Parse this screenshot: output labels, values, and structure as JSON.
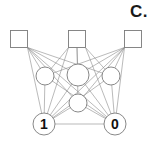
{
  "figure": {
    "panel_label": "C.",
    "width": 154,
    "height": 145,
    "background_color": "#ffffff",
    "edge_color": "#8c8c8c",
    "node_stroke_color": "#7a7a7a",
    "node_fill_color": "#ffffff",
    "label_color": "#111111"
  },
  "chart_data": {
    "type": "diagram",
    "title": "C.",
    "layers": [
      {
        "name": "top-layer",
        "shape": "square",
        "nodes": [
          {
            "id": "s1",
            "label": "",
            "x": 19,
            "y": 39,
            "size": 17
          },
          {
            "id": "s2",
            "label": "",
            "x": 77,
            "y": 39,
            "size": 17
          },
          {
            "id": "s3",
            "label": "",
            "x": 133,
            "y": 39,
            "size": 17
          }
        ]
      },
      {
        "name": "hidden-layer",
        "shape": "circle",
        "nodes": [
          {
            "id": "h1",
            "label": "",
            "x": 45,
            "y": 76,
            "r": 9
          },
          {
            "id": "h2",
            "label": "",
            "x": 78,
            "y": 75,
            "r": 11
          },
          {
            "id": "h3",
            "label": "",
            "x": 111,
            "y": 76,
            "r": 9
          },
          {
            "id": "h4",
            "label": "",
            "x": 78,
            "y": 103,
            "r": 9
          }
        ]
      },
      {
        "name": "bottom-layer",
        "shape": "circle",
        "nodes": [
          {
            "id": "b1",
            "label": "1",
            "x": 44,
            "y": 124,
            "r": 11
          },
          {
            "id": "b2",
            "label": "0",
            "x": 115,
            "y": 124,
            "r": 11
          }
        ]
      }
    ],
    "edges": [
      {
        "from": "s1",
        "to": "h1"
      },
      {
        "from": "s1",
        "to": "h2"
      },
      {
        "from": "s1",
        "to": "h3"
      },
      {
        "from": "s1",
        "to": "h4"
      },
      {
        "from": "s1",
        "to": "b1"
      },
      {
        "from": "s1",
        "to": "b2"
      },
      {
        "from": "s2",
        "to": "h1"
      },
      {
        "from": "s2",
        "to": "h2"
      },
      {
        "from": "s2",
        "to": "h3"
      },
      {
        "from": "s2",
        "to": "h4"
      },
      {
        "from": "s2",
        "to": "b1"
      },
      {
        "from": "s2",
        "to": "b2"
      },
      {
        "from": "s3",
        "to": "h1"
      },
      {
        "from": "s3",
        "to": "h2"
      },
      {
        "from": "s3",
        "to": "h3"
      },
      {
        "from": "s3",
        "to": "h4"
      },
      {
        "from": "s3",
        "to": "b1"
      },
      {
        "from": "s3",
        "to": "b2"
      },
      {
        "from": "h1",
        "to": "b1"
      },
      {
        "from": "h1",
        "to": "b2"
      },
      {
        "from": "h2",
        "to": "b1"
      },
      {
        "from": "h2",
        "to": "b2"
      },
      {
        "from": "h3",
        "to": "b1"
      },
      {
        "from": "h3",
        "to": "b2"
      },
      {
        "from": "h4",
        "to": "b1"
      },
      {
        "from": "h4",
        "to": "b2"
      },
      {
        "from": "b1",
        "to": "b2"
      }
    ],
    "node_count": 9,
    "edge_count": 27
  }
}
